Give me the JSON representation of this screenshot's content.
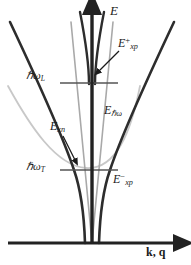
{
  "figure": {
    "name": "exciton-polariton-dispersion",
    "background_color": "#ffffff",
    "ink_color": "#2a2a2a",
    "faint_color": "#b9b9b9",
    "axes": {
      "vertical_axis_label": "E",
      "horizontal_axis_label": "k, q",
      "vertical_axis_name": "energy-axis",
      "horizontal_axis_name": "wavevector-axis",
      "origin_x": 92,
      "origin_y": 243,
      "x_axis_start": 8,
      "x_axis_end": 182,
      "y_axis_top": 5
    },
    "levels": [
      {
        "id": "hw-L",
        "label_html": "&#8463;&omega;<sub>L</sub>",
        "label_text": "ℏω_L",
        "y": 83,
        "line_x_start": 60,
        "line_x_end": 118
      },
      {
        "id": "hw-T",
        "label_html": "&#8463;&omega;<sub>T</sub>",
        "label_text": "ℏω_T",
        "y": 170,
        "line_x_start": 60,
        "line_x_end": 118
      }
    ],
    "curves": [
      {
        "id": "upper-polariton-branch",
        "label_text": "E⁺xp",
        "color": "#2a2a2a",
        "width": 2.4,
        "description": "upper polariton branch, rises steeply from near hw_L toward the energy axis at large k"
      },
      {
        "id": "lower-polariton-branch",
        "label_text": "E⁻xp",
        "color": "#2a2a2a",
        "width": 2.4,
        "description": "lower polariton branch, photon-like at small k then flattens toward hw_T"
      },
      {
        "id": "photon-line",
        "label_text": "Eℏω",
        "color": "#6a6a6a",
        "width": 1.4,
        "description": "bare photon dispersion, straight line through origin"
      },
      {
        "id": "exciton-parabola",
        "label_text": "Exn",
        "color": "#c2c2c2",
        "width": 1.6,
        "description": "bare exciton dispersion parabola with minimum at hw_T"
      }
    ],
    "labels": [
      {
        "id": "E",
        "html": "E",
        "text": "E"
      },
      {
        "id": "Exp-plus",
        "html": "E<sup>+</sup><sub>xp</sub>",
        "text": "E+xp"
      },
      {
        "id": "hwL",
        "html": "&#8463;&omega;<sub>L</sub>",
        "text": "ℏωL"
      },
      {
        "id": "Ehw",
        "html": "E<sub>&#8463;&omega;</sub>",
        "text": "Eℏω"
      },
      {
        "id": "Exn",
        "html": "E<sub>xn</sub>",
        "text": "Exn"
      },
      {
        "id": "hwT",
        "html": "&#8463;&omega;<sub>T</sub>",
        "text": "ℏωT"
      },
      {
        "id": "Exp-minus",
        "html": "E<sup>&minus;</sup><sub>xp</sub>",
        "text": "E−xp"
      },
      {
        "id": "kq",
        "html": "k, q",
        "text": "k, q"
      }
    ],
    "annotations": [
      {
        "id": "arrow-to-upper-branch",
        "from_x": 117,
        "from_y": 52,
        "to_x": 98,
        "to_y": 72,
        "description": "arrow from E+xp label to upper polariton branch"
      },
      {
        "id": "arrow-to-exciton",
        "from_x": 64,
        "from_y": 137,
        "to_x": 75,
        "to_y": 161,
        "description": "arrow from Exn label to exciton parabola"
      }
    ]
  },
  "chart_data": {
    "type": "line",
    "title": "",
    "xlabel": "k, q",
    "ylabel": "E",
    "grid": false,
    "legend": "none",
    "annotations": [
      "E+xp",
      "E-xp",
      "Eℏω",
      "Exn",
      "ℏωL",
      "ℏωT"
    ],
    "series": [
      {
        "name": "E+xp",
        "comment": "upper polariton branch — energy (arb. units) vs wavevector",
        "x": [
          0,
          4,
          8,
          12,
          16,
          22,
          30,
          45,
          70,
          100
        ],
        "y": [
          86,
          86.5,
          88,
          91,
          96,
          108,
          128,
          170,
          230,
          300
        ]
      },
      {
        "name": "E-xp",
        "comment": "lower polariton branch — photon-like then saturating at ℏωT",
        "x": [
          0,
          5,
          12,
          22,
          35,
          50,
          70,
          90,
          100
        ],
        "y": [
          0,
          14,
          34,
          58,
          76,
          86,
          91,
          93,
          94
        ]
      },
      {
        "name": "Eℏω",
        "comment": "bare photon straight line",
        "x": [
          0,
          100
        ],
        "y": [
          0,
          300
        ]
      },
      {
        "name": "Exn",
        "comment": "bare exciton parabola, minimum ℏωT",
        "x": [
          -100,
          -60,
          -30,
          0,
          30,
          60,
          100
        ],
        "y": [
          130,
          108,
          97,
          94,
          97,
          108,
          130
        ]
      }
    ],
    "level_lines": [
      {
        "name": "ℏωL",
        "y": 112
      },
      {
        "name": "ℏωT",
        "y": 94
      }
    ]
  }
}
